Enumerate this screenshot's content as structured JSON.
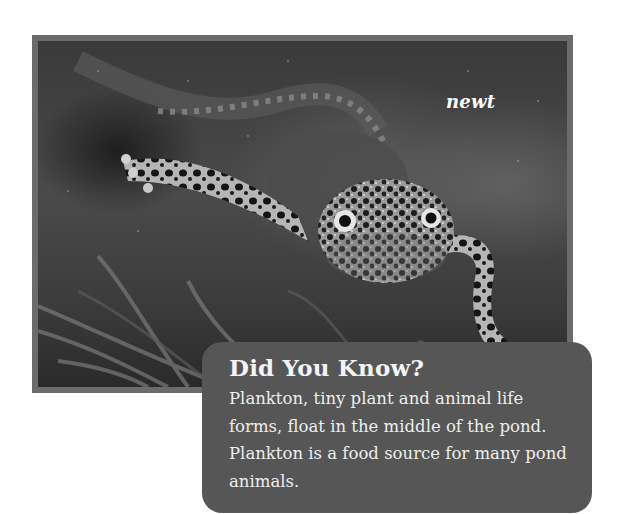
{
  "photo": {
    "caption_label": "newt",
    "subject": "newt swimming underwater",
    "frame_color": "#6b6b6b"
  },
  "fact_box": {
    "title": "Did You Know?",
    "body": "Plankton, tiny plant and animal life forms, float in the middle of the pond. Plankton is a food source for many pond animals.",
    "background_color": "#565656"
  }
}
